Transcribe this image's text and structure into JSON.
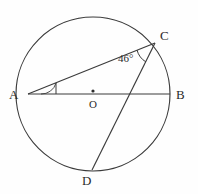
{
  "figure": {
    "background_color": "#fefefe",
    "stroke_color": "#3a3a3a",
    "label_color": "#2b2b2b"
  },
  "circle": {
    "center_label": "O",
    "center_x": 93,
    "center_y": 94,
    "radius": 77
  },
  "points": [
    {
      "name": "A",
      "label": "A",
      "x": 28,
      "y": 94,
      "label_x": 9,
      "label_y": 88
    },
    {
      "name": "B",
      "label": "B",
      "x": 170,
      "y": 94,
      "label_x": 176,
      "label_y": 88
    },
    {
      "name": "C",
      "label": "C",
      "x": 155,
      "y": 43,
      "label_x": 160,
      "label_y": 29
    },
    {
      "name": "D",
      "label": "D",
      "x": 92,
      "y": 170,
      "label_x": 82,
      "label_y": 174
    },
    {
      "name": "O",
      "label": "O",
      "x": 93,
      "y": 94,
      "label_x": 89,
      "label_y": 99
    }
  ],
  "segments": [
    {
      "name": "chord-AB-diameter",
      "from": "A",
      "to": "B"
    },
    {
      "name": "chord-AC",
      "from": "A",
      "to": "C"
    },
    {
      "name": "chord-CD",
      "from": "C",
      "to": "D"
    }
  ],
  "angles": [
    {
      "name": "angle-at-C",
      "vertex": "C",
      "value": "46°",
      "label_x": 118,
      "label_y": 53
    },
    {
      "name": "angle-at-A",
      "vertex": "A",
      "value": "",
      "marked": true
    }
  ]
}
